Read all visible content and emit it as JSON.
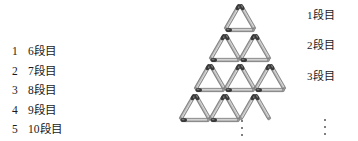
{
  "choices": {
    "items": [
      {
        "num": "1",
        "label": "6段目"
      },
      {
        "num": "2",
        "label": "7段目"
      },
      {
        "num": "3",
        "label": "8段目"
      },
      {
        "num": "4",
        "label": "9段目"
      },
      {
        "num": "5",
        "label": "10段目"
      }
    ]
  },
  "figure": {
    "row_labels": [
      {
        "text": "1段目"
      },
      {
        "text": "2段目"
      },
      {
        "text": "3段目"
      }
    ],
    "continuation_marks": [
      {
        "name": "bottom-ellipsis",
        "glyph": "⋮"
      },
      {
        "name": "right-ellipsis",
        "glyph": "⋮"
      }
    ],
    "rows_drawn": 4,
    "colors": {
      "match_head": "#3a3a3a",
      "match_shaft": "#b8b8b8",
      "match_outline": "#6e6e6e",
      "text": "#1a1a1a",
      "background": "#ffffff"
    },
    "geometry": {
      "apex_x": 240,
      "apex_y": 4,
      "row_height": 30,
      "half_width": 17.5
    }
  }
}
